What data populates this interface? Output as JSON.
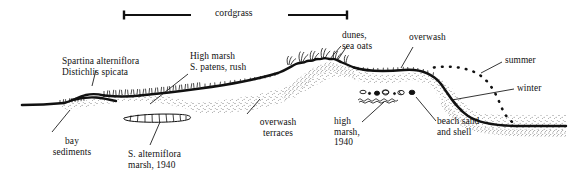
{
  "figure": {
    "type": "geologic-cross-section",
    "background_color": "#ffffff",
    "ink_color": "#111111"
  },
  "scale_bar": {
    "label": "cordgrass",
    "left_segment": {
      "x1": 123,
      "x2": 191,
      "y": 15,
      "tick_end": "left"
    },
    "right_segment": {
      "x1": 288,
      "x2": 348,
      "y": 15,
      "tick_end": "right"
    }
  },
  "labels": [
    {
      "name": "spartina-distichlis",
      "lines": [
        "Spartina alterniflora",
        "Distichlis spicata"
      ],
      "x": 62,
      "y": 57,
      "align": "left"
    },
    {
      "name": "high-marsh-patens",
      "lines": [
        "High marsh",
        "S. patens, rush"
      ],
      "x": 190,
      "y": 52,
      "align": "left"
    },
    {
      "name": "dunes-sea-oats",
      "lines": [
        "dunes,",
        "sea oats"
      ],
      "x": 343,
      "y": 31,
      "align": "left"
    },
    {
      "name": "overwash",
      "lines": [
        "overwash"
      ],
      "x": 410,
      "y": 33,
      "align": "left"
    },
    {
      "name": "summer",
      "lines": [
        "summer"
      ],
      "x": 505,
      "y": 56,
      "align": "left"
    },
    {
      "name": "winter",
      "lines": [
        "winter"
      ],
      "x": 517,
      "y": 84,
      "align": "left"
    },
    {
      "name": "bay-sediments",
      "lines": [
        "bay",
        "sediments"
      ],
      "x": 27,
      "y": 137,
      "align": "left"
    },
    {
      "name": "s-alterniflora-marsh-1940",
      "lines": [
        "S. alterniflora",
        "marsh, 1940"
      ],
      "x": 128,
      "y": 150,
      "align": "left"
    },
    {
      "name": "overwash-terraces",
      "lines": [
        "overwash",
        "terraces"
      ],
      "x": 246,
      "y": 118,
      "align": "left"
    },
    {
      "name": "high-marsh-1940",
      "lines": [
        "high",
        "marsh,",
        "1940"
      ],
      "x": 334,
      "y": 117,
      "align": "left"
    },
    {
      "name": "beach-sand-and-shell",
      "lines": [
        "beach sand",
        "and shell"
      ],
      "x": 437,
      "y": 117,
      "align": "left"
    }
  ],
  "leader_lines": [
    {
      "name": "leader-spartina",
      "points": "96,69 92,86"
    },
    {
      "name": "leader-high-marsh",
      "points": "188,73 150,105"
    },
    {
      "name": "leader-dunes-a",
      "points": "342,45 330,62"
    },
    {
      "name": "leader-dunes-b",
      "points": "346,46 336,62"
    },
    {
      "name": "leader-overwash",
      "points": "412,46 400,70"
    },
    {
      "name": "leader-summer",
      "points": "503,62 480,74"
    },
    {
      "name": "leader-winter",
      "points": "515,89 455,101"
    },
    {
      "name": "leader-bay-sediments",
      "points": "52,133 70,110"
    },
    {
      "name": "leader-marsh-1940",
      "points": "150,146 160,119"
    },
    {
      "name": "leader-overwash-terraces",
      "points": "245,114 258,100"
    },
    {
      "name": "leader-high-marsh-1940",
      "points": "364,122 386,100"
    },
    {
      "name": "leader-beach-sand",
      "points": "435,122 414,98"
    }
  ],
  "profiles": {
    "winter_surface": {
      "name": "winter-profile",
      "style": "solid",
      "stroke_width": 2.4
    },
    "summer_surface": {
      "name": "summer-profile",
      "style": "dotted",
      "description": "dotted berm profile seaward of the overwash flat"
    }
  },
  "units": [
    {
      "name": "bay-sediments-unit",
      "pattern": "blank-with-stipple-edge"
    },
    {
      "name": "overwash-sand-unit",
      "pattern": "fine-stipple"
    },
    {
      "name": "buried-marsh-1940-lens",
      "pattern": "cell-hatched-lens"
    },
    {
      "name": "buried-high-marsh-1940",
      "pattern": "squiggle-line"
    },
    {
      "name": "beach-shell-layer",
      "pattern": "shell-symbols"
    },
    {
      "name": "marsh-grass-fringe",
      "pattern": "vertical-tufts"
    },
    {
      "name": "dune-grass-tufts",
      "pattern": "sea-oat-tufts"
    }
  ]
}
